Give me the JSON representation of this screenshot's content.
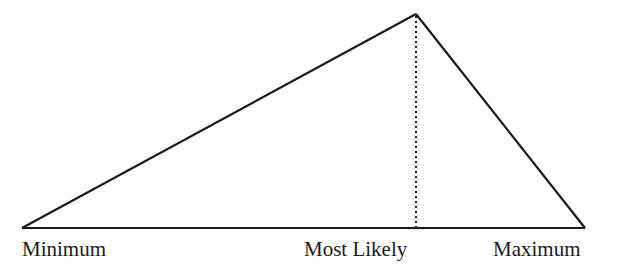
{
  "diagram": {
    "type": "triangular-distribution",
    "colors": {
      "line": "#1a1a1a",
      "background": "#ffffff"
    },
    "points": {
      "minimum": {
        "x": 22,
        "y": 228
      },
      "most_likely": {
        "x": 416,
        "y": 14
      },
      "maximum": {
        "x": 585,
        "y": 228
      }
    },
    "labels": {
      "minimum": "Minimum",
      "most_likely": "Most Likely",
      "maximum": "Maximum"
    }
  }
}
